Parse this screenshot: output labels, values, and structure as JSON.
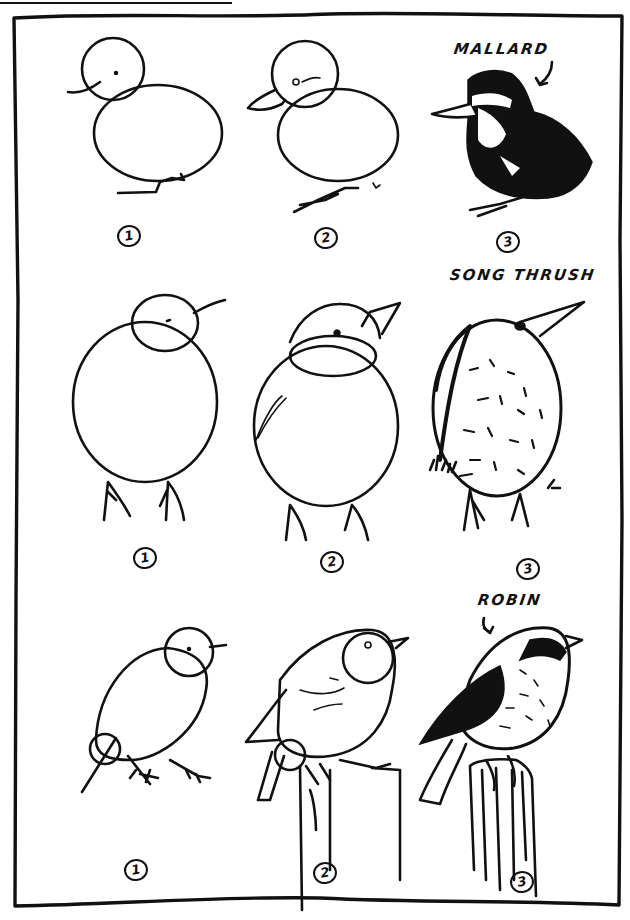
{
  "page": {
    "kind": "how-to-draw-birds illustration page",
    "ink_color": "#111111",
    "paper_color": "#ffffff"
  },
  "rows": [
    {
      "bird": "MALLARD",
      "label_has_arrow": true,
      "steps": [
        "1",
        "2",
        "3"
      ],
      "step_descriptions": [
        "Construction: small head circle overlapping large egg-shaped body, beak line, legs",
        "Refined outline: duck bill, eye, webbed foot",
        "Finished fluffy duckling with dark down"
      ]
    },
    {
      "bird": "SONG THRUSH",
      "label_has_arrow": false,
      "steps": [
        "1",
        "2",
        "3"
      ],
      "step_descriptions": [
        "Construction: head circle overlapping large oval body, beak line, two legs",
        "Refined outline: pointed beak, eye, wing strokes",
        "Finished speckled thrush standing in grass"
      ]
    },
    {
      "bird": "ROBIN",
      "label_has_arrow": true,
      "steps": [
        "1",
        "2",
        "3"
      ],
      "step_descriptions": [
        "Construction: head circle, tilted oval body, hip circle, tail line, feet",
        "Refined outline: beak, eye, wing, tail, perched on a post",
        "Finished robin perched on a wooden post"
      ]
    }
  ]
}
